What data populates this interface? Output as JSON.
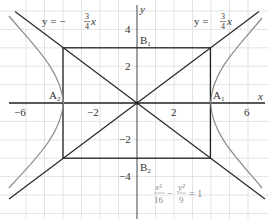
{
  "diagram": {
    "axes": {
      "x_label": "x",
      "y_label": "y",
      "x_ticks": [
        "−6",
        "−2",
        "2",
        "6"
      ],
      "y_ticks": [
        "4",
        "2",
        "−2",
        "−4"
      ]
    },
    "points": {
      "A1": {
        "label": "A",
        "sub": "1",
        "x": 4,
        "y": 0
      },
      "A2": {
        "label": "A",
        "sub": "2",
        "x": -4,
        "y": 0
      },
      "B1": {
        "label": "B",
        "sub": "1",
        "x": 0,
        "y": 3
      },
      "B2": {
        "label": "B",
        "sub": "2",
        "x": 0,
        "y": -3
      }
    },
    "asymptotes": {
      "positive": {
        "prefix": "y = ",
        "num": "3",
        "den": "4",
        "var": "x"
      },
      "negative": {
        "prefix": "y = −",
        "num": "3",
        "den": "4",
        "var": "x"
      }
    },
    "equation": {
      "t1_num": "x²",
      "t1_den": "16",
      "minus": "−",
      "t2_num": "y²",
      "t2_den": "9",
      "rhs": "= 1"
    },
    "colors": {
      "grid": "#d9d9d9",
      "axis": "#222222",
      "rectangle": "#222222",
      "asymptote": "#222222",
      "hyperbola": "#8a8a8a",
      "equation_text": "#888888"
    }
  }
}
